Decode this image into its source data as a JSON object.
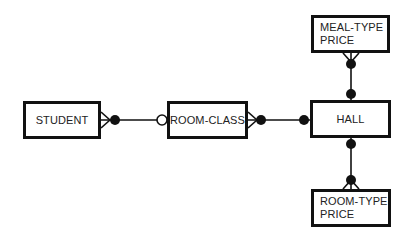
{
  "diagram": {
    "type": "entity-relationship",
    "notation": "crow's foot",
    "line_color": "#111111",
    "entities": [
      {
        "id": "student",
        "label": "STUDENT"
      },
      {
        "id": "room_class",
        "label": "ROOM-CLASS"
      },
      {
        "id": "hall",
        "label": "HALL"
      },
      {
        "id": "meal_type_price",
        "label": "MEAL-TYPE\nPRICE"
      },
      {
        "id": "room_type_price",
        "label": "ROOM-TYPE\nPRICE"
      }
    ],
    "relationships": [
      {
        "from": "student",
        "from_end": "many-mandatory",
        "to": "room_class",
        "to_end": "one-optional"
      },
      {
        "from": "room_class",
        "from_end": "many-mandatory",
        "to": "hall",
        "to_end": "one-mandatory"
      },
      {
        "from": "meal_type_price",
        "from_end": "many-mandatory",
        "to": "hall",
        "to_end": "one-mandatory"
      },
      {
        "from": "room_type_price",
        "from_end": "many-mandatory",
        "to": "hall",
        "to_end": "one-mandatory"
      }
    ]
  }
}
